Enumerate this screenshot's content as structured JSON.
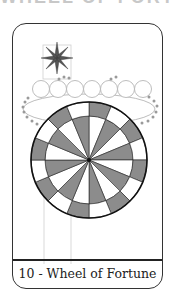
{
  "header": {
    "clipped_title": "WHEEL OF FORTUNE"
  },
  "card": {
    "number": "10",
    "name": "Wheel of Fortune",
    "caption": "10 - Wheel of Fortune",
    "colors": {
      "border": "#333333",
      "segment_fill": "#8c8c8c",
      "star_fill": "#555555",
      "cloud_dot": "#9a9a9a",
      "guide_line": "#cfcfcf"
    },
    "icons": {
      "star": "eight-point-star",
      "wheel": "wheel-16-segments",
      "cloud": "cloud-of-circles"
    }
  }
}
